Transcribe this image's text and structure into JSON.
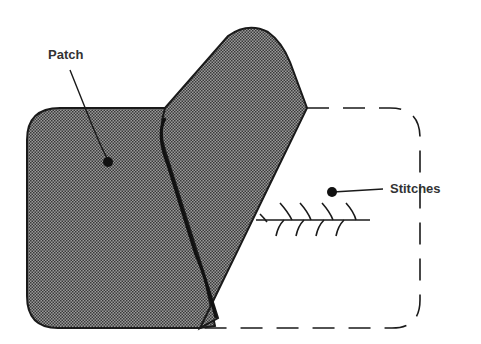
{
  "diagram": {
    "labels": {
      "patch": "Patch",
      "stitches": "Stitches"
    },
    "colors": {
      "patch_fill": "#8a8a8a",
      "outline": "#1a1a1a",
      "background": "#ffffff"
    }
  }
}
